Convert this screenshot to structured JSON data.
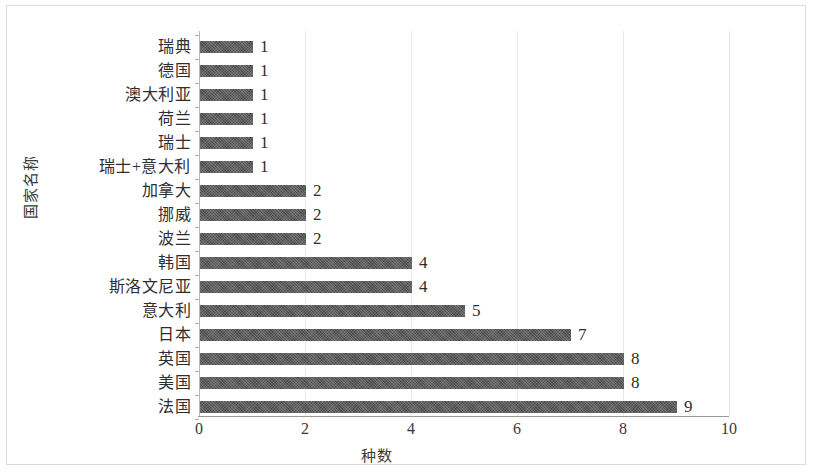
{
  "chart_data": {
    "type": "bar",
    "orientation": "horizontal",
    "title": "",
    "xlabel": "种数",
    "ylabel": "国家名称",
    "xlim": [
      0,
      10
    ],
    "xticks": [
      "0",
      "2",
      "4",
      "6",
      "8",
      "10"
    ],
    "xtick_values": [
      0,
      2,
      4,
      6,
      8,
      10
    ],
    "grid": "vertical",
    "legend": "none",
    "bar_color": "#4b4b4b",
    "categories": [
      "瑞典",
      "德国",
      "澳大利亚",
      "荷兰",
      "瑞士",
      "瑞士+意大利",
      "加拿大",
      "挪威",
      "波兰",
      "韩国",
      "斯洛文尼亚",
      "意大利",
      "日本",
      "英国",
      "美国",
      "法国"
    ],
    "values": [
      1,
      1,
      1,
      1,
      1,
      1,
      2,
      2,
      2,
      4,
      4,
      5,
      7,
      8,
      8,
      9
    ],
    "data_labels": [
      "1",
      "1",
      "1",
      "1",
      "1",
      "1",
      "2",
      "2",
      "2",
      "4",
      "4",
      "5",
      "7",
      "8",
      "8",
      "9"
    ]
  }
}
